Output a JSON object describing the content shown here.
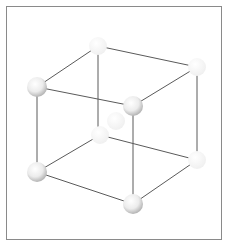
{
  "diagram": {
    "type": "cubic-lattice-unit-cell",
    "colors": {
      "frame": "#8a8a8a",
      "edge": "#5a5a5a",
      "atom": "#e8e8e8"
    },
    "atoms": [
      {
        "id": "back-top-left",
        "x": 98,
        "y": 46,
        "r": 9,
        "faded": true
      },
      {
        "id": "back-top-right",
        "x": 197,
        "y": 67,
        "r": 9,
        "faded": true
      },
      {
        "id": "back-bottom-left",
        "x": 100,
        "y": 135,
        "r": 9,
        "faded": true
      },
      {
        "id": "back-bottom-right",
        "x": 197,
        "y": 160,
        "r": 9,
        "faded": true
      },
      {
        "id": "center-faint",
        "x": 116,
        "y": 121,
        "r": 9,
        "faded": true
      },
      {
        "id": "front-top-left",
        "x": 37,
        "y": 87,
        "r": 10,
        "faded": false
      },
      {
        "id": "front-top-right",
        "x": 133,
        "y": 106,
        "r": 10,
        "faded": false
      },
      {
        "id": "front-bottom-left",
        "x": 37,
        "y": 172,
        "r": 10,
        "faded": false
      },
      {
        "id": "front-bottom-right",
        "x": 133,
        "y": 204,
        "r": 10,
        "faded": false
      }
    ]
  }
}
